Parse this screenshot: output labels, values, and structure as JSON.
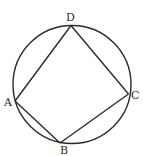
{
  "diagram": {
    "stroke_color": "#2a2a2a",
    "circle": {
      "cx": 72,
      "cy": 84.5,
      "r": 59
    },
    "points": {
      "A": {
        "x": 15,
        "y": 101,
        "label": "A",
        "lx": 4,
        "ly": 106
      },
      "B": {
        "x": 60,
        "y": 143,
        "label": "B",
        "lx": 60,
        "ly": 154
      },
      "C": {
        "x": 128.5,
        "y": 94,
        "label": "C",
        "lx": 131,
        "ly": 99
      },
      "D": {
        "x": 71,
        "y": 25.5,
        "label": "D",
        "lx": 66,
        "ly": 21
      }
    },
    "segments": [
      [
        "A",
        "D"
      ],
      [
        "D",
        "C"
      ],
      [
        "C",
        "B"
      ],
      [
        "B",
        "A"
      ]
    ]
  }
}
